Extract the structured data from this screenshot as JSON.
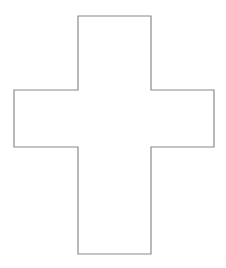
{
  "figure": {
    "shape": "cross-outline",
    "stroke_color": "#8a8a8a",
    "fill_color": "#ffffff",
    "background_color": "#ffffff",
    "stroke_width": 1.2,
    "points": "78,16 151,16 151,90 214,90 214,147 151,147 151,254 78,254 78,147 14,147 14,90 78,90"
  }
}
